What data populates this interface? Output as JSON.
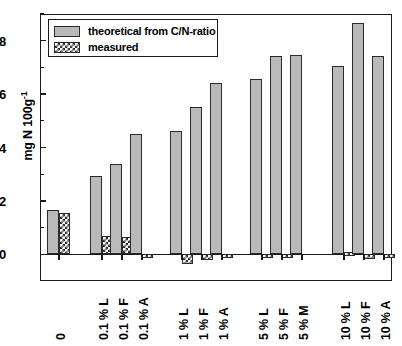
{
  "chart_data": {
    "type": "bar",
    "title": "",
    "xlabel": "",
    "ylabel": "mg N 100g",
    "ylabel_exponent": "-1",
    "ylim": [
      -1.0,
      9.0
    ],
    "yticks": [
      0,
      2,
      4,
      6,
      8
    ],
    "ytick_labels": [
      "0",
      "2",
      "4",
      "6",
      "8"
    ],
    "yminor_ticks": [
      1,
      3,
      5,
      7,
      9
    ],
    "grid": false,
    "legend_position": "upper-left",
    "categories": [
      "0",
      "0.1 % L",
      "0.1 % F",
      "0.1 % A",
      "1 % L",
      "1 % F",
      "1 % A",
      "5 % L",
      "5 % F",
      "5 % M",
      "10 % L",
      "10 % F",
      "10 % A"
    ],
    "series": [
      {
        "name": "theoretical from C/N-ratio",
        "fill": "solid-gray",
        "color": "#b9b9b9",
        "values": [
          1.65,
          2.95,
          3.4,
          4.5,
          4.6,
          5.5,
          6.4,
          6.55,
          7.42,
          7.45,
          7.05,
          8.65,
          7.42
        ]
      },
      {
        "name": "measured",
        "fill": "checkerboard",
        "color": "#2e2e2e",
        "values": [
          1.55,
          0.7,
          0.65,
          -0.07,
          -0.35,
          -0.22,
          -0.1,
          -0.06,
          -0.05,
          0.0,
          0.1,
          -0.18,
          -0.08
        ]
      }
    ]
  },
  "legend": {
    "items": [
      {
        "label": "theoretical from C/N-ratio",
        "swatch": "solid-gray"
      },
      {
        "label": "measured",
        "swatch": "checkerboard"
      }
    ]
  },
  "axis": {
    "y_label_text": "mg N 100g",
    "y_label_sup": "-1"
  }
}
